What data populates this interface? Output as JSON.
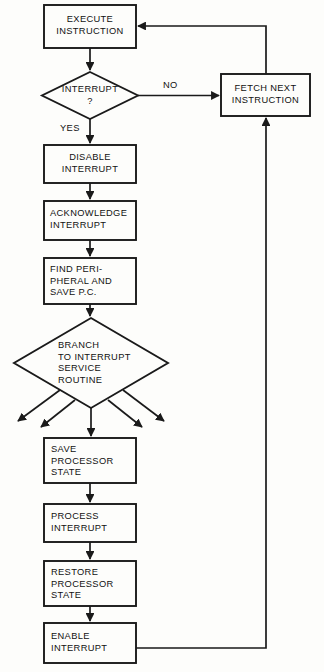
{
  "diagram": {
    "stroke_color": "#1a1a1a",
    "text_color": "#111111",
    "background_color": "#fdfdfb",
    "nodes": [
      {
        "id": "execute-instruction",
        "shape": "process",
        "text": "EXECUTE\nINSTRUCTION",
        "align": "center",
        "x": 44,
        "y": 5,
        "w": 92,
        "h": 43
      },
      {
        "id": "interrupt-decision",
        "shape": "decision",
        "text": "INTERRUPT\n?",
        "align": "center",
        "x": 42,
        "y": 72,
        "w": 96,
        "h": 47
      },
      {
        "id": "fetch-next-instruction",
        "shape": "process",
        "text": "FETCH NEXT\nINSTRUCTION",
        "align": "center",
        "x": 221,
        "y": 74,
        "w": 89,
        "h": 42
      },
      {
        "id": "disable-interrupt",
        "shape": "process",
        "text": "DISABLE\nINTERRUPT",
        "align": "center",
        "x": 44,
        "y": 145,
        "w": 92,
        "h": 38
      },
      {
        "id": "acknowledge-interrupt",
        "shape": "process",
        "text": "ACKNOWLEDGE\nINTERRUPT",
        "align": "left",
        "x": 44,
        "y": 201,
        "w": 92,
        "h": 39
      },
      {
        "id": "find-peripheral-save-pc",
        "shape": "process",
        "text": "FIND PERI-\nPHERAL AND\nSAVE P.C.",
        "align": "left",
        "x": 44,
        "y": 258,
        "w": 92,
        "h": 46
      },
      {
        "id": "branch-to-interrupt-service-routine",
        "shape": "decision",
        "text": "BRANCH\nTO INTERRUPT\nSERVICE\nROUTINE",
        "align": "left",
        "x": 14,
        "y": 318,
        "w": 154,
        "h": 90
      },
      {
        "id": "save-processor-state",
        "shape": "process",
        "text": "SAVE\nPROCESSOR\nSTATE",
        "align": "left",
        "x": 44,
        "y": 438,
        "w": 92,
        "h": 45
      },
      {
        "id": "process-interrupt",
        "shape": "process",
        "text": "PROCESS\nINTERRUPT",
        "align": "left",
        "x": 44,
        "y": 504,
        "w": 92,
        "h": 38
      },
      {
        "id": "restore-processor-state",
        "shape": "process",
        "text": "RESTORE\nPROCESSOR\nSTATE",
        "align": "left",
        "x": 44,
        "y": 561,
        "w": 92,
        "h": 45
      },
      {
        "id": "enable-interrupt",
        "shape": "process",
        "text": "ENABLE\nINTERRUPT",
        "align": "left",
        "x": 44,
        "y": 623,
        "w": 92,
        "h": 40
      }
    ],
    "edge_labels": [
      {
        "id": "branch-no",
        "text": "NO",
        "x": 163,
        "y": 80
      },
      {
        "id": "branch-yes",
        "text": "YES",
        "x": 60,
        "y": 123
      }
    ],
    "edges": [
      {
        "id": "execute-to-interrupt",
        "from": "execute-instruction",
        "to": "interrupt-decision"
      },
      {
        "id": "interrupt-no-to-fetch",
        "from": "interrupt-decision",
        "to": "fetch-next-instruction",
        "label": "NO"
      },
      {
        "id": "fetch-to-execute-return",
        "from": "fetch-next-instruction",
        "to": "execute-instruction"
      },
      {
        "id": "interrupt-yes-to-disable",
        "from": "interrupt-decision",
        "to": "disable-interrupt",
        "label": "YES"
      },
      {
        "id": "disable-to-acknowledge",
        "from": "disable-interrupt",
        "to": "acknowledge-interrupt"
      },
      {
        "id": "acknowledge-to-find",
        "from": "acknowledge-interrupt",
        "to": "find-peripheral-save-pc"
      },
      {
        "id": "find-to-branch",
        "from": "find-peripheral-save-pc",
        "to": "branch-to-interrupt-service-routine"
      },
      {
        "id": "branch-fanout",
        "from": "branch-to-interrupt-service-routine",
        "to": "save-processor-state",
        "count": 5
      },
      {
        "id": "save-to-process",
        "from": "save-processor-state",
        "to": "process-interrupt"
      },
      {
        "id": "process-to-restore",
        "from": "process-interrupt",
        "to": "restore-processor-state"
      },
      {
        "id": "restore-to-enable",
        "from": "restore-processor-state",
        "to": "enable-interrupt"
      },
      {
        "id": "enable-to-fetch-return",
        "from": "enable-interrupt",
        "to": "fetch-next-instruction"
      }
    ]
  }
}
